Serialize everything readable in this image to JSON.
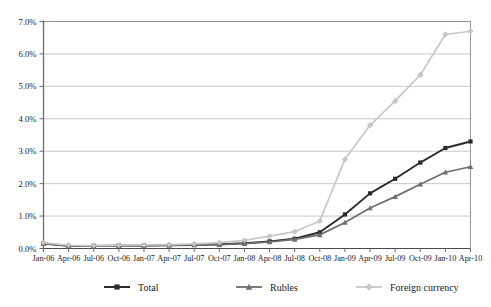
{
  "chart_data": {
    "type": "line",
    "title": "",
    "xlabel": "",
    "ylabel": "",
    "ylim": [
      0.0,
      7.0
    ],
    "ytick_values": [
      0.0,
      1.0,
      2.0,
      3.0,
      4.0,
      5.0,
      6.0,
      7.0
    ],
    "ytick_labels": [
      "0.0%",
      "1.0%",
      "2.0%",
      "3.0%",
      "4.0%",
      "5.0%",
      "6.0%",
      "7.0%"
    ],
    "grid": true,
    "legend_position": "bottom",
    "categories": [
      "Jan-06",
      "Apr-06",
      "Jul-06",
      "Oct-06",
      "Jan-07",
      "Apr-07",
      "Jul-07",
      "Oct-07",
      "Jan-08",
      "Apr-08",
      "Jul-08",
      "Oct-08",
      "Jan-09",
      "Apr-09",
      "Jul-09",
      "Oct-09",
      "Jan-10",
      "Apr-10"
    ],
    "series": [
      {
        "name": "Total",
        "color": "#2b2b2b",
        "marker": "square",
        "values": [
          0.15,
          0.08,
          0.08,
          0.09,
          0.09,
          0.1,
          0.11,
          0.13,
          0.16,
          0.22,
          0.3,
          0.5,
          1.05,
          1.7,
          2.15,
          2.65,
          3.1,
          3.3
        ]
      },
      {
        "name": "Rubles",
        "color": "#6e6e6e",
        "marker": "triangle",
        "values": [
          0.15,
          0.08,
          0.08,
          0.09,
          0.09,
          0.1,
          0.11,
          0.12,
          0.15,
          0.2,
          0.28,
          0.42,
          0.8,
          1.25,
          1.6,
          1.98,
          2.35,
          2.52
        ]
      },
      {
        "name": "Foreign currency",
        "color": "#c8c8c8",
        "marker": "diamond",
        "values": [
          0.18,
          0.1,
          0.09,
          0.1,
          0.11,
          0.12,
          0.14,
          0.18,
          0.25,
          0.38,
          0.52,
          0.85,
          2.75,
          3.8,
          4.55,
          5.35,
          6.6,
          6.7
        ]
      }
    ]
  },
  "legend": {
    "items": [
      {
        "label": "Total"
      },
      {
        "label": "Rubles"
      },
      {
        "label": "Foreign currency"
      }
    ]
  }
}
